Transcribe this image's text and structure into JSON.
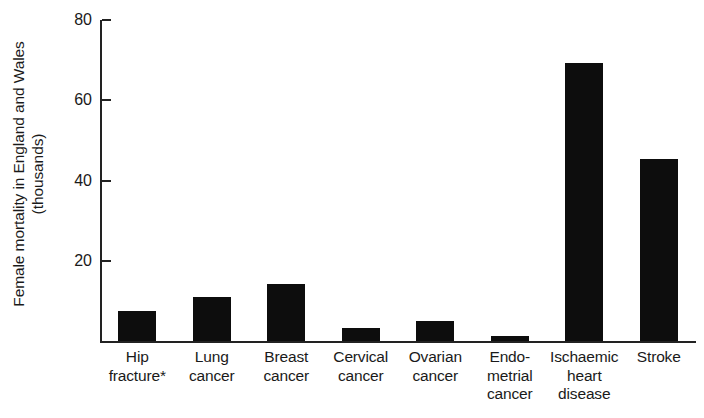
{
  "chart_data": {
    "type": "bar",
    "title": "",
    "xlabel": "",
    "ylabel": "Female mortality in England and Wales (thousands)",
    "ylabel_lines": [
      "Female mortality in England and Wales",
      "(thousands)"
    ],
    "ylim": [
      0,
      80
    ],
    "yticks": [
      20,
      40,
      60,
      80
    ],
    "ytick_labels": [
      "20",
      "40",
      "60",
      "80"
    ],
    "grid": false,
    "legend": null,
    "bar_color": "#0d0d0d",
    "axis_color": "#222222",
    "footnote_marker": "*",
    "categories": [
      "Hip fracture*",
      "Lung cancer",
      "Breast cancer",
      "Cervical cancer",
      "Ovarian cancer",
      "Endometrial cancer",
      "Ischaemic heart disease",
      "Stroke"
    ],
    "category_label_lines": [
      [
        "Hip",
        "fracture*"
      ],
      [
        "Lung",
        "cancer"
      ],
      [
        "Breast",
        "cancer"
      ],
      [
        "Cervical",
        "cancer"
      ],
      [
        "Ovarian",
        "cancer"
      ],
      [
        "Endo-",
        "metrial",
        "cancer"
      ],
      [
        "Ischaemic",
        "heart",
        "disease"
      ],
      [
        "Stroke"
      ]
    ],
    "values": [
      7.4,
      10.9,
      14.1,
      3.2,
      5.0,
      1.2,
      69.4,
      45.4
    ],
    "units": "thousands of deaths"
  }
}
